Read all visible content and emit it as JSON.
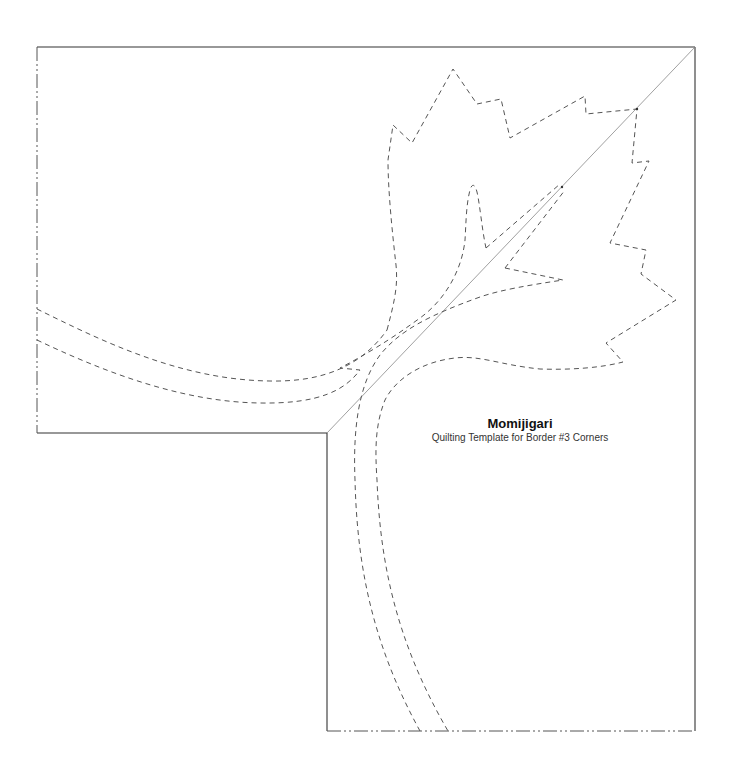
{
  "template": {
    "title": "Momijigari",
    "subtitle": "Quilting Template for Border #3 Corners"
  },
  "diagram": {
    "type": "quilting-template",
    "shape": "L-shaped border corner with diagonal miter line",
    "motif": "maple leaf with curved stem (dashed quilting lines)",
    "line_styles": {
      "outline": "solid",
      "fold_edges": "dash-dot",
      "quilting_lines": "dashed",
      "miter_line": "thin solid diagonal"
    },
    "colors": {
      "outline": "#333333",
      "quilting": "#555555",
      "miter": "#888888",
      "background": "#ffffff"
    }
  }
}
